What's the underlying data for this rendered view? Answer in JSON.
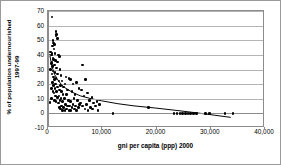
{
  "chart_data": {
    "type": "scatter",
    "title": "",
    "xlabel": "gni per capita (ppp) 2000",
    "ylabel_line1": "% of population undernourished",
    "ylabel_line2": "1997-99",
    "xlim": [
      0,
      40000
    ],
    "ylim": [
      -10,
      70
    ],
    "xticks": [
      0,
      10000,
      20000,
      30000,
      40000
    ],
    "xticklabels": [
      "0",
      "10,000",
      "20,000",
      "30,000",
      "40,000"
    ],
    "yticks": [
      -10,
      0,
      10,
      20,
      30,
      40,
      50,
      60,
      70
    ],
    "yticklabels": [
      "-10",
      "0",
      "10",
      "20",
      "30",
      "40",
      "50",
      "60",
      "70"
    ],
    "grid": "horizontal",
    "legend": "none",
    "marker_color": "#000000",
    "trendline_color": "#000000",
    "gridline_color": "#b4b4b4",
    "axis_color": "#8c8c8c",
    "points": [
      [
        700,
        66
      ],
      [
        400,
        7.5
      ],
      [
        1500,
        56
      ],
      [
        1600,
        54
      ],
      [
        1450,
        53
      ],
      [
        1700,
        51
      ],
      [
        900,
        50
      ],
      [
        1000,
        48
      ],
      [
        1200,
        47
      ],
      [
        800,
        46
      ],
      [
        1100,
        44
      ],
      [
        500,
        42
      ],
      [
        700,
        41
      ],
      [
        1300,
        41
      ],
      [
        600,
        40
      ],
      [
        1900,
        40
      ],
      [
        2100,
        39
      ],
      [
        900,
        38
      ],
      [
        1050,
        37
      ],
      [
        1400,
        36
      ],
      [
        700,
        35
      ],
      [
        1750,
        35
      ],
      [
        600,
        34
      ],
      [
        1200,
        33
      ],
      [
        6400,
        33
      ],
      [
        800,
        32
      ],
      [
        1600,
        31
      ],
      [
        500,
        30
      ],
      [
        2200,
        30
      ],
      [
        900,
        29
      ],
      [
        1300,
        28
      ],
      [
        700,
        27
      ],
      [
        1800,
        27
      ],
      [
        2400,
        26
      ],
      [
        1000,
        25
      ],
      [
        3300,
        25
      ],
      [
        1500,
        24
      ],
      [
        3900,
        24
      ],
      [
        4100,
        23
      ],
      [
        6900,
        23
      ],
      [
        1200,
        23
      ],
      [
        2000,
        22
      ],
      [
        2600,
        22
      ],
      [
        5200,
        21
      ],
      [
        800,
        21
      ],
      [
        1400,
        20
      ],
      [
        3100,
        20
      ],
      [
        4600,
        20
      ],
      [
        1000,
        19
      ],
      [
        2300,
        19
      ],
      [
        1700,
        18
      ],
      [
        2900,
        18
      ],
      [
        600,
        17
      ],
      [
        1300,
        17
      ],
      [
        5700,
        17
      ],
      [
        2100,
        16
      ],
      [
        3600,
        16
      ],
      [
        6200,
        16
      ],
      [
        900,
        15
      ],
      [
        1600,
        15
      ],
      [
        2500,
        15
      ],
      [
        4400,
        15
      ],
      [
        7300,
        14
      ],
      [
        1100,
        14
      ],
      [
        2800,
        13
      ],
      [
        3400,
        13
      ],
      [
        5000,
        13
      ],
      [
        1400,
        12
      ],
      [
        2000,
        12
      ],
      [
        6600,
        12
      ],
      [
        8100,
        11
      ],
      [
        1800,
        11
      ],
      [
        2400,
        10
      ],
      [
        3000,
        10
      ],
      [
        4800,
        10
      ],
      [
        600,
        10
      ],
      [
        1200,
        9
      ],
      [
        2200,
        9
      ],
      [
        3800,
        9
      ],
      [
        5400,
        9
      ],
      [
        7600,
        9
      ],
      [
        9000,
        8
      ],
      [
        1500,
        8
      ],
      [
        2700,
        8
      ],
      [
        4200,
        8
      ],
      [
        6000,
        7
      ],
      [
        8400,
        7
      ],
      [
        1900,
        7
      ],
      [
        3200,
        6
      ],
      [
        4600,
        6
      ],
      [
        5800,
        6
      ],
      [
        7100,
        6
      ],
      [
        9500,
        6
      ],
      [
        2500,
        5
      ],
      [
        3600,
        5
      ],
      [
        4000,
        5
      ],
      [
        5100,
        5
      ],
      [
        6400,
        5
      ],
      [
        8800,
        5
      ],
      [
        2100,
        4
      ],
      [
        2900,
        4
      ],
      [
        4400,
        4
      ],
      [
        5600,
        4
      ],
      [
        7800,
        4
      ],
      [
        18500,
        4
      ],
      [
        2300,
        3
      ],
      [
        3400,
        3
      ],
      [
        4900,
        3
      ],
      [
        6800,
        3
      ],
      [
        8200,
        3
      ],
      [
        2700,
        2
      ],
      [
        3900,
        2
      ],
      [
        5300,
        2
      ],
      [
        7400,
        2
      ],
      [
        9200,
        2
      ],
      [
        3100,
        2
      ],
      [
        4200,
        2
      ],
      [
        12000,
        0
      ],
      [
        23200,
        0
      ],
      [
        23800,
        0
      ],
      [
        24300,
        0
      ],
      [
        24800,
        0
      ],
      [
        25300,
        0
      ],
      [
        25800,
        0
      ],
      [
        26300,
        0
      ],
      [
        26800,
        0
      ],
      [
        27400,
        0
      ],
      [
        29000,
        0
      ],
      [
        29800,
        0
      ],
      [
        32600,
        0
      ],
      [
        34100,
        0
      ]
    ],
    "trendline": [
      [
        300,
        40
      ],
      [
        700,
        32
      ],
      [
        1200,
        26
      ],
      [
        2000,
        21
      ],
      [
        3000,
        17
      ],
      [
        4500,
        13.5
      ],
      [
        6000,
        11
      ],
      [
        8000,
        9
      ],
      [
        10000,
        7.5
      ],
      [
        13000,
        5.5
      ],
      [
        16000,
        4
      ],
      [
        20000,
        2.5
      ],
      [
        24000,
        0.8
      ],
      [
        28000,
        -1
      ],
      [
        31000,
        -2.5
      ],
      [
        34000,
        -4
      ]
    ]
  }
}
